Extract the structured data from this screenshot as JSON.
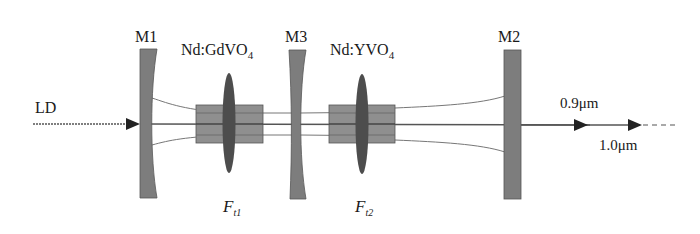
{
  "diagram": {
    "type": "laser-cavity-schematic",
    "colors": {
      "mirror": "#7a7a7a",
      "crystal": "#8c8c8c",
      "lens": "#4a4a4a",
      "beam": "#555555",
      "arrow": "#222222"
    },
    "labels": {
      "pump": "LD",
      "mirror1": "M1",
      "mirror2": "M2",
      "mirror3": "M3",
      "crystal1_main": "Nd:GdVO",
      "crystal1_sub": "4",
      "crystal2_main": "Nd:YVO",
      "crystal2_sub": "4",
      "lens1_main": "F",
      "lens1_sub": "t1",
      "lens2_main": "F",
      "lens2_sub": "t2",
      "output1": "0.9μm",
      "output2": "1.0μm"
    },
    "components": [
      {
        "id": "LD",
        "kind": "pump-source",
        "label": "LD"
      },
      {
        "id": "M1",
        "kind": "concave-mirror"
      },
      {
        "id": "crystal1",
        "kind": "gain-crystal",
        "label": "Nd:GdVO4"
      },
      {
        "id": "Ft1",
        "kind": "thermal-lens"
      },
      {
        "id": "M3",
        "kind": "concave-mirror"
      },
      {
        "id": "crystal2",
        "kind": "gain-crystal",
        "label": "Nd:YVO4"
      },
      {
        "id": "Ft2",
        "kind": "thermal-lens"
      },
      {
        "id": "M2",
        "kind": "flat-output-mirror"
      }
    ],
    "outputs": [
      "0.9μm",
      "1.0μm"
    ]
  }
}
